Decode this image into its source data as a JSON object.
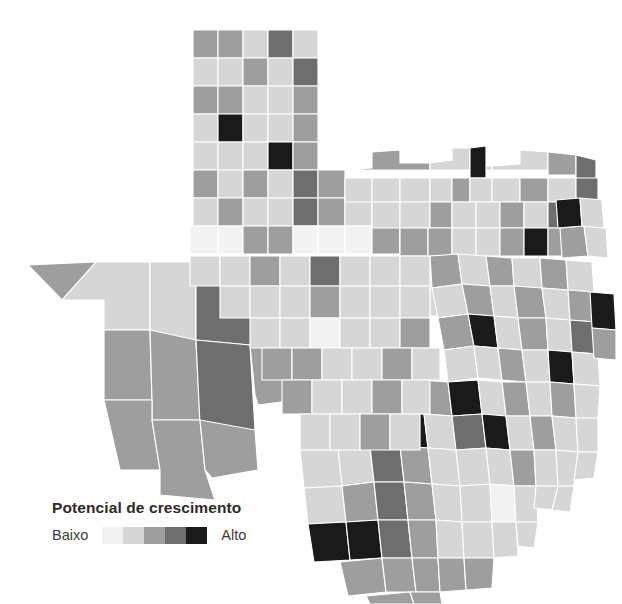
{
  "figure": {
    "kind": "choropleth-map",
    "region": "Texas",
    "background_color": "#ffffff",
    "border_color": "#ffffff"
  },
  "legend": {
    "title": "Potencial de crescimento",
    "low_label": "Baixo",
    "high_label": "Alto",
    "bins": [
      {
        "rank": 1,
        "label": "Baixo",
        "color": "#f2f2f2"
      },
      {
        "rank": 2,
        "label": "Baixo-medio",
        "color": "#d6d6d6"
      },
      {
        "rank": 3,
        "label": "Medio",
        "color": "#9e9e9e"
      },
      {
        "rank": 4,
        "label": "Medio-alto",
        "color": "#6e6e6e"
      },
      {
        "rank": 5,
        "label": "Alto",
        "color": "#1a1a1a"
      }
    ]
  },
  "chart_data": {
    "type": "heatmap",
    "title": "Potencial de crescimento",
    "xlabel": "",
    "ylabel": "",
    "legend_position": "bottom-left",
    "grid": false,
    "value_scale": {
      "kind": "sequential-ordinal",
      "classes": 5,
      "low_label": "Baixo",
      "high_label": "Alto",
      "colors": [
        "#f2f2f2",
        "#d6d6d6",
        "#9e9e9e",
        "#6e6e6e",
        "#1a1a1a"
      ]
    },
    "categories": [
      "Baixo",
      "Baixo-medio",
      "Medio",
      "Medio-alto",
      "Alto"
    ],
    "values": [
      62,
      58,
      70,
      44,
      20
    ],
    "note": "Contagem aproximada de condados por classe de potencial de crescimento",
    "regions": [
      {
        "id": "p1",
        "bin": 3
      },
      {
        "id": "p2",
        "bin": 3
      },
      {
        "id": "p3",
        "bin": 2
      },
      {
        "id": "p4",
        "bin": 4
      },
      {
        "id": "p5",
        "bin": 2
      },
      {
        "id": "p6",
        "bin": 2
      },
      {
        "id": "p7",
        "bin": 2
      },
      {
        "id": "p8",
        "bin": 3
      },
      {
        "id": "p9",
        "bin": 2
      },
      {
        "id": "p10",
        "bin": 4
      },
      {
        "id": "p11",
        "bin": 3
      },
      {
        "id": "p12",
        "bin": 2
      },
      {
        "id": "p13",
        "bin": 2
      },
      {
        "id": "p14",
        "bin": 2
      },
      {
        "id": "p15",
        "bin": 3
      },
      {
        "id": "p16",
        "bin": 2
      },
      {
        "id": "p17",
        "bin": 5
      },
      {
        "id": "p18",
        "bin": 2
      },
      {
        "id": "p19",
        "bin": 2
      },
      {
        "id": "p20",
        "bin": 3
      },
      {
        "id": "p21",
        "bin": 2
      },
      {
        "id": "p22",
        "bin": 2
      },
      {
        "id": "p23",
        "bin": 2
      },
      {
        "id": "p24",
        "bin": 5
      },
      {
        "id": "p25",
        "bin": 3
      },
      {
        "id": "p26",
        "bin": 3
      },
      {
        "id": "p27",
        "bin": 2
      },
      {
        "id": "p28",
        "bin": 3
      },
      {
        "id": "p29",
        "bin": 5
      },
      {
        "id": "p30",
        "bin": 3
      },
      {
        "id": "p31",
        "bin": 3
      },
      {
        "id": "p32",
        "bin": 3
      },
      {
        "id": "p33",
        "bin": 2
      },
      {
        "id": "p34",
        "bin": 2
      },
      {
        "id": "p35",
        "bin": 4
      },
      {
        "id": "p36",
        "bin": 2
      },
      {
        "id": "p37",
        "bin": 4
      },
      {
        "id": "p38",
        "bin": 2
      },
      {
        "id": "p39",
        "bin": 3
      },
      {
        "id": "p40",
        "bin": 4
      },
      {
        "id": "n1",
        "bin": 3
      },
      {
        "id": "n2",
        "bin": 2
      },
      {
        "id": "n3",
        "bin": 5
      },
      {
        "id": "n4",
        "bin": 2
      },
      {
        "id": "n5",
        "bin": 3
      },
      {
        "id": "n6",
        "bin": 4
      },
      {
        "id": "n7",
        "bin": 3
      },
      {
        "id": "n8",
        "bin": 2
      },
      {
        "id": "n9",
        "bin": 4
      },
      {
        "id": "n10",
        "bin": 5
      },
      {
        "id": "w1",
        "bin": 3
      },
      {
        "id": "w2",
        "bin": 2
      },
      {
        "id": "w3",
        "bin": 3
      },
      {
        "id": "w4",
        "bin": 4
      },
      {
        "id": "w5",
        "bin": 3
      },
      {
        "id": "w6",
        "bin": 3
      },
      {
        "id": "w7",
        "bin": 4
      },
      {
        "id": "w8",
        "bin": 3
      },
      {
        "id": "w9",
        "bin": 3
      },
      {
        "id": "w10",
        "bin": 3
      },
      {
        "id": "c1",
        "bin": 2
      },
      {
        "id": "c2",
        "bin": 3
      },
      {
        "id": "c3",
        "bin": 2
      },
      {
        "id": "c4",
        "bin": 5
      },
      {
        "id": "c5",
        "bin": 3
      },
      {
        "id": "c6",
        "bin": 2
      },
      {
        "id": "c7",
        "bin": 3
      },
      {
        "id": "c8",
        "bin": 5
      },
      {
        "id": "c9",
        "bin": 2
      },
      {
        "id": "c10",
        "bin": 4
      },
      {
        "id": "e1",
        "bin": 3
      },
      {
        "id": "e2",
        "bin": 5
      },
      {
        "id": "e3",
        "bin": 2
      },
      {
        "id": "e4",
        "bin": 3
      },
      {
        "id": "e5",
        "bin": 5
      },
      {
        "id": "e6",
        "bin": 2
      },
      {
        "id": "e7",
        "bin": 3
      },
      {
        "id": "e8",
        "bin": 2
      },
      {
        "id": "e9",
        "bin": 4
      },
      {
        "id": "e10",
        "bin": 2
      },
      {
        "id": "s1",
        "bin": 5
      },
      {
        "id": "s2",
        "bin": 3
      },
      {
        "id": "s3",
        "bin": 2
      },
      {
        "id": "s4",
        "bin": 3
      },
      {
        "id": "s5",
        "bin": 4
      },
      {
        "id": "s6",
        "bin": 2
      },
      {
        "id": "s7",
        "bin": 3
      },
      {
        "id": "s8",
        "bin": 2
      },
      {
        "id": "s9",
        "bin": 3
      },
      {
        "id": "s10",
        "bin": 5
      }
    ]
  }
}
